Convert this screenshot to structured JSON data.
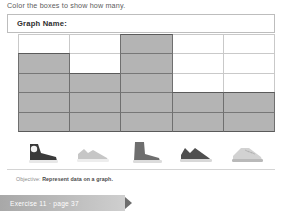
{
  "instruction": "Color the boxes to show how many.",
  "worksheet": {
    "graph_name_label": "Graph Name:"
  },
  "footer": {
    "objective_prefix": "Objective:",
    "objective_text": "Represent data on a graph.",
    "exercise_label": "Exercise 11 · page 37"
  },
  "colors": {
    "filled_cell": "#b4b4b4",
    "grid_line": "#c9c9c9",
    "bar_outline": "#6f6f6f",
    "banner": "#bfbfbf"
  },
  "chart_data": {
    "type": "bar",
    "title": "Graph Name:",
    "xlabel": "",
    "ylabel": "",
    "ylim": [
      0,
      5
    ],
    "grid": true,
    "legend": "none",
    "categories": [
      "high-top-sneaker",
      "light-low-sneaker",
      "ankle-boot",
      "dark-low-sneaker",
      "dress-shoe"
    ],
    "values": [
      4,
      3,
      5,
      2,
      2
    ],
    "rows": 5,
    "columns": 5
  },
  "shoes": [
    {
      "name": "high-top-sneaker-icon",
      "shade": "#3a3a3a",
      "sole": "#e8e8e8"
    },
    {
      "name": "light-low-sneaker-icon",
      "shade": "#c6c6c6",
      "sole": "#ededed"
    },
    {
      "name": "ankle-boot-icon",
      "shade": "#6e6e6e",
      "sole": "#dcdcdc"
    },
    {
      "name": "dark-low-sneaker-icon",
      "shade": "#4f4f4f",
      "sole": "#d8d8d8"
    },
    {
      "name": "dress-shoe-icon",
      "shade": "#d2d2d2",
      "sole": "#b9b9b9"
    }
  ]
}
